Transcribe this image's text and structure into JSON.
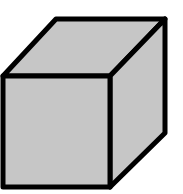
{
  "diagram": {
    "shape": "cube",
    "fill_color": "#c6c6c6",
    "stroke_color": "#000000",
    "stroke_width": 5,
    "faces": {
      "front": "3,76 110,76 110,187 3,187",
      "top": "3,76 56,19 165,19 110,76",
      "right": "110,76 165,19 165,133 110,187"
    }
  }
}
